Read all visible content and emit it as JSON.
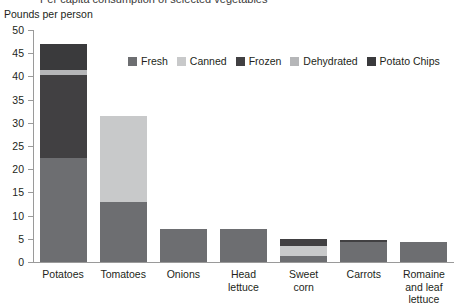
{
  "title_clipped": "Per capita consumption of selected vegetables",
  "axis_title": "Pounds per person",
  "chart_data": {
    "type": "bar",
    "subtype": "stacked-vertical",
    "title": "Per capita consumption of selected vegetables",
    "xlabel": "",
    "ylabel": "Pounds per person",
    "ylim": [
      0,
      50
    ],
    "yticks": [
      0,
      5,
      10,
      15,
      20,
      25,
      30,
      35,
      40,
      45,
      50
    ],
    "ytick_labels": [
      "0",
      "5",
      "10",
      "15",
      "20",
      "25",
      "30",
      "35",
      "40",
      "45",
      "50"
    ],
    "grid": false,
    "legend_position": "top-center",
    "categories": [
      "Potatoes",
      "Tomatoes",
      "Onions",
      "Head lettuce",
      "Sweet corn",
      "Carrots",
      "Romaine and leaf lettuce"
    ],
    "category_labels": [
      [
        "Potatoes"
      ],
      [
        "Tomatoes"
      ],
      [
        "Onions"
      ],
      [
        "Head",
        "lettuce"
      ],
      [
        "Sweet",
        "corn"
      ],
      [
        "Carrots"
      ],
      [
        "Romaine",
        "and leaf",
        "lettuce"
      ]
    ],
    "series": [
      {
        "name": "Fresh",
        "color": "#6d6e71",
        "values": [
          22.5,
          13.0,
          7.2,
          7.1,
          1.3,
          4.4,
          4.3
        ]
      },
      {
        "name": "Canned",
        "color": "#c8c9ca",
        "values": [
          0.0,
          18.5,
          0.0,
          0.0,
          2.2,
          0.0,
          0.0
        ]
      },
      {
        "name": "Frozen",
        "color": "#414042",
        "values": [
          17.8,
          0.0,
          0.0,
          0.0,
          1.5,
          0.3,
          0.0
        ]
      },
      {
        "name": "Dehydrated",
        "color": "#b5b6b8",
        "values": [
          1.1,
          0.0,
          0.0,
          0.0,
          0.0,
          0.0,
          0.0
        ]
      },
      {
        "name": "Potato Chips",
        "color": "#3a3a3c",
        "values": [
          5.5,
          0.0,
          0.0,
          0.0,
          0.0,
          0.0,
          0.0
        ]
      }
    ],
    "totals": [
      46.9,
      31.5,
      7.2,
      7.1,
      5.0,
      4.7,
      4.3
    ]
  },
  "legend": {
    "items": [
      {
        "label": "Fresh",
        "color": "#6d6e71"
      },
      {
        "label": "Canned",
        "color": "#c8c9ca"
      },
      {
        "label": "Frozen",
        "color": "#414042"
      },
      {
        "label": "Dehydrated",
        "color": "#b5b6b8"
      },
      {
        "label": "Potato Chips",
        "color": "#3a3a3c"
      }
    ]
  },
  "colors": {
    "background": "#ffffff",
    "axis": "#9a9a9a",
    "text": "#231f20"
  }
}
